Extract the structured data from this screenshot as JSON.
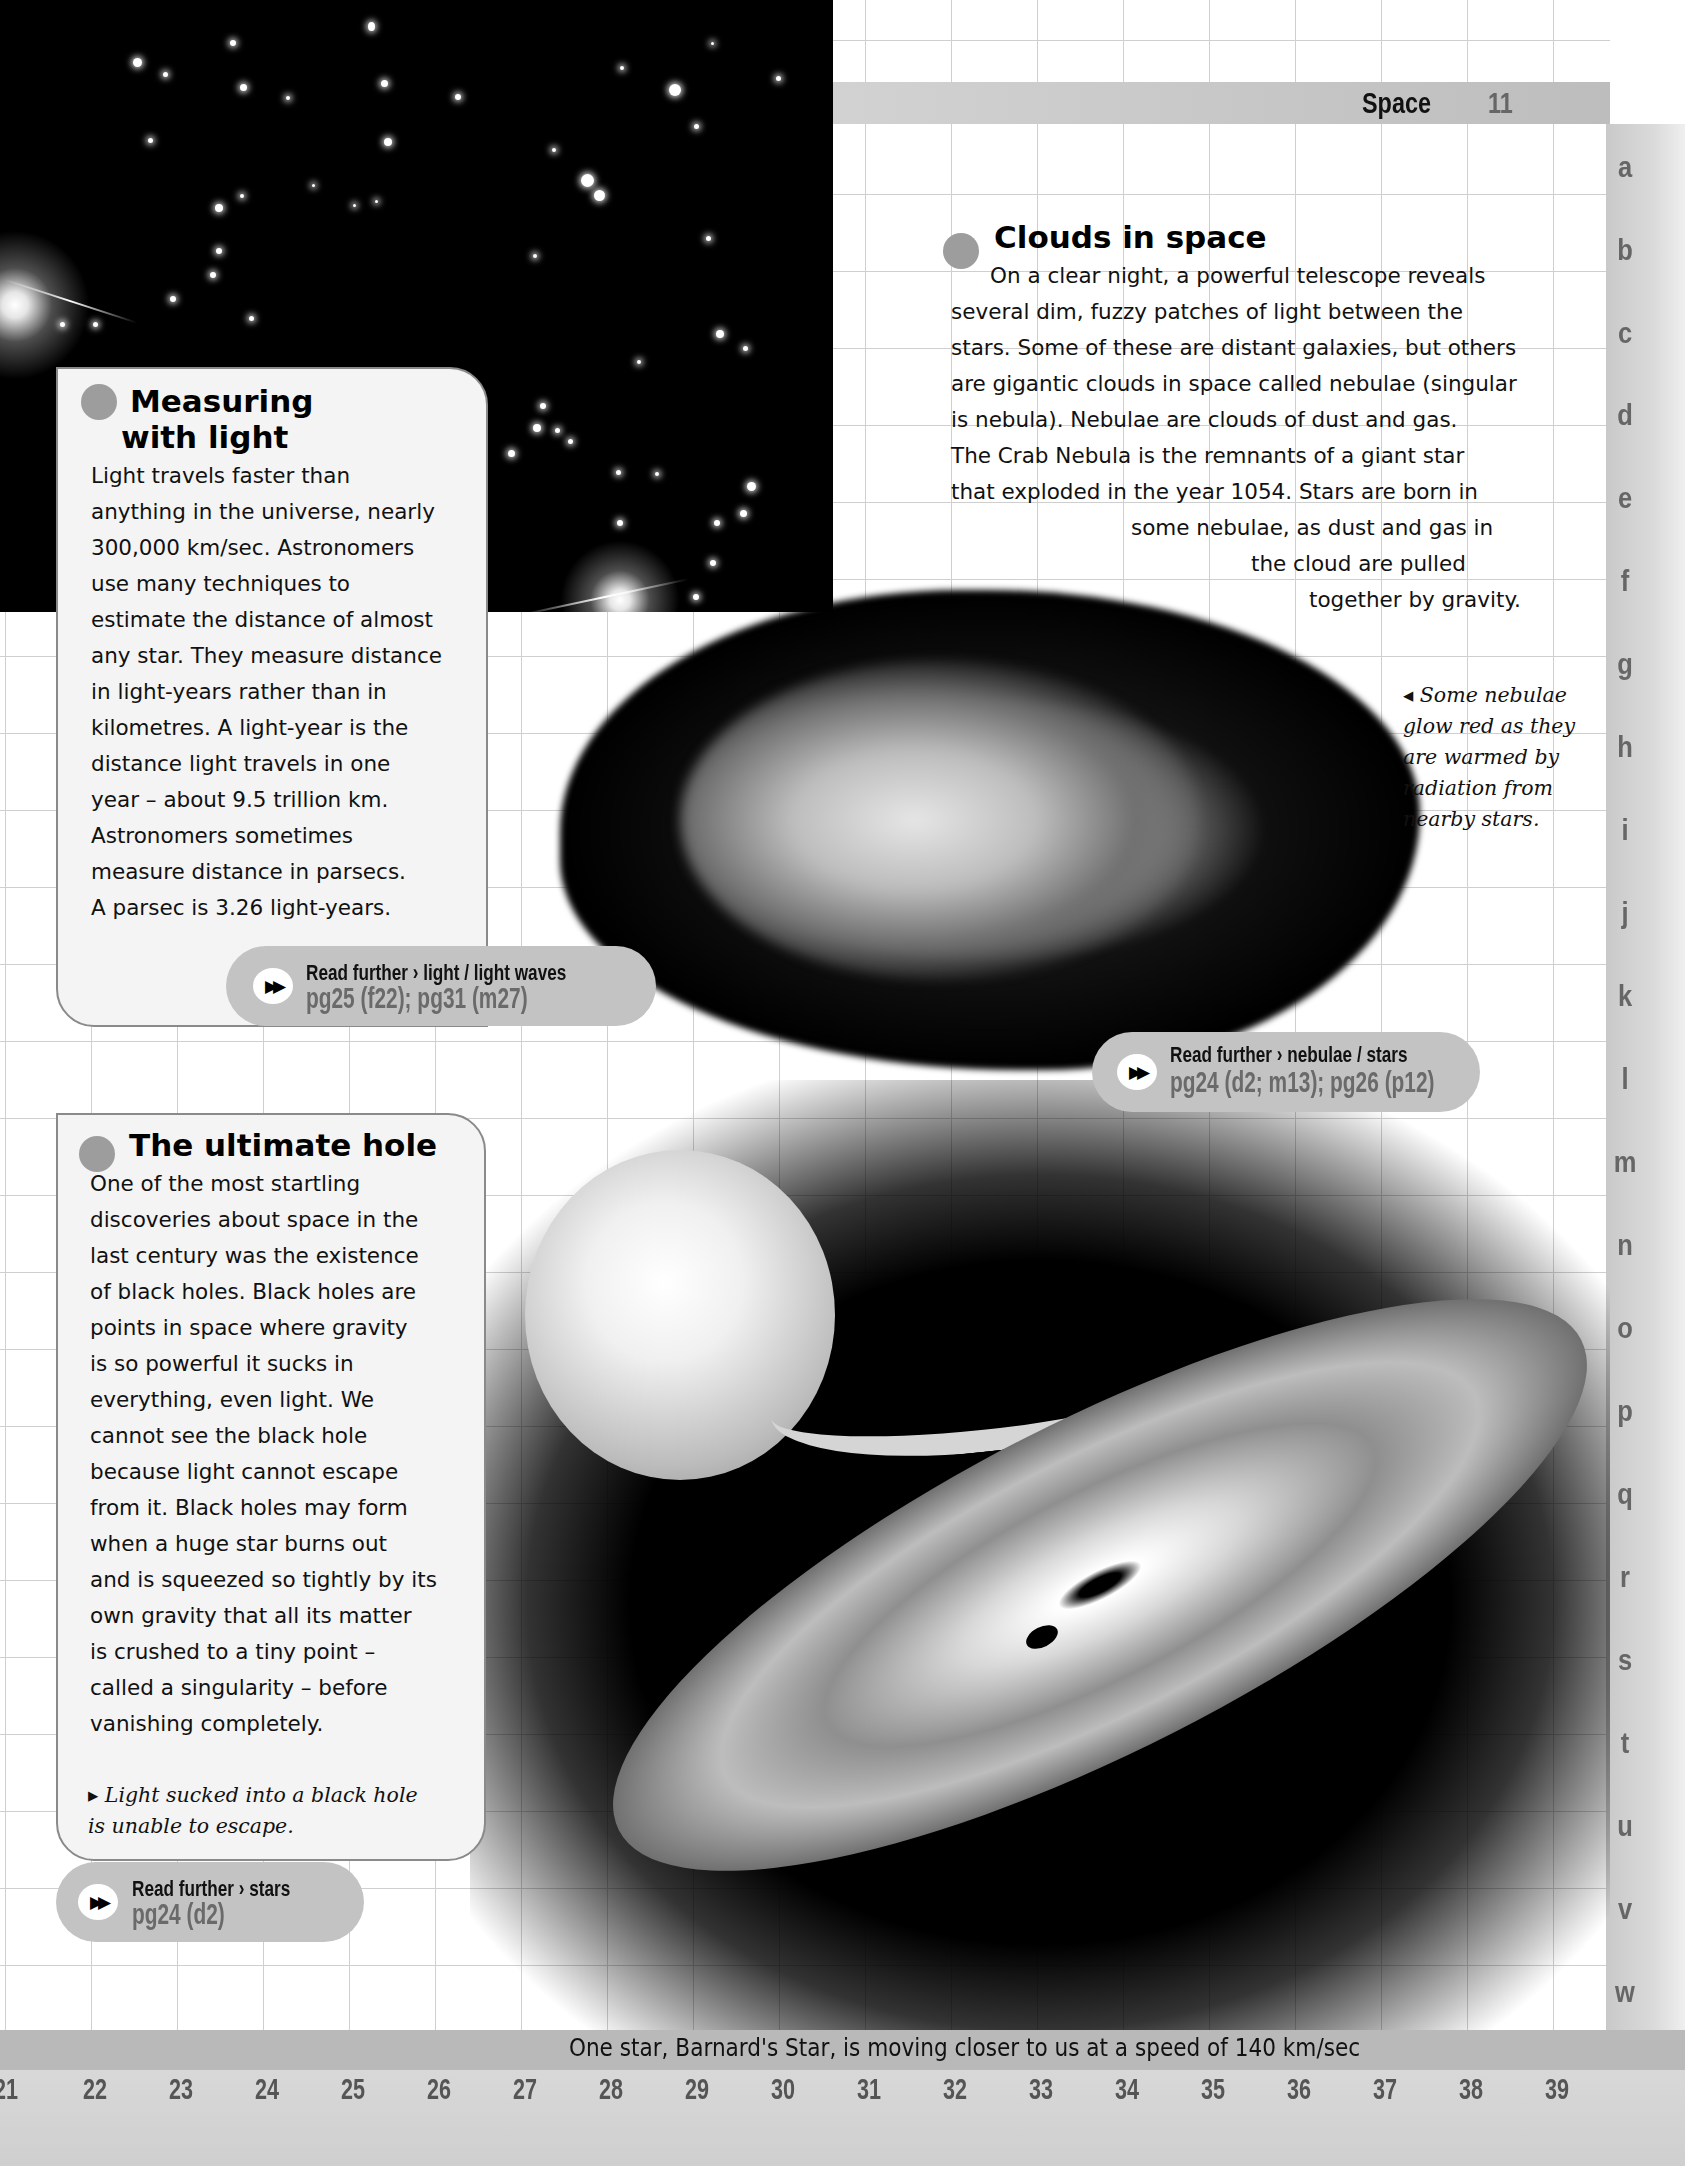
{
  "header": {
    "section_title": "Space",
    "page_number": "11"
  },
  "row_letters": [
    "a",
    "b",
    "c",
    "d",
    "e",
    "f",
    "g",
    "h",
    "i",
    "j",
    "k",
    "l",
    "m",
    "n",
    "o",
    "p",
    "q",
    "r",
    "s",
    "t",
    "u",
    "v",
    "w"
  ],
  "column_numbers": [
    "21",
    "22",
    "23",
    "24",
    "25",
    "26",
    "27",
    "28",
    "29",
    "30",
    "31",
    "32",
    "33",
    "34",
    "35",
    "36",
    "37",
    "38",
    "39"
  ],
  "clouds_in_space": {
    "heading": "Clouds in space",
    "lines": [
      "On a clear night, a powerful telescope reveals",
      "several dim, fuzzy patches of light between the",
      "stars. Some of these are distant galaxies, but others",
      "are gigantic clouds in space called nebulae (singular",
      "is nebula). Nebulae are clouds of dust and gas.",
      "The Crab Nebula is the remnants of a giant star",
      "that exploded in the year 1054. Stars are born in",
      "some nebulae, as dust and gas in",
      "the cloud are pulled",
      "together by gravity."
    ],
    "caption": "◂ Some nebulae\nglow red as they\nare warmed by\nradiation from\nnearby stars.",
    "read_further": {
      "line1": "Read further › nebulae / stars",
      "line2": "pg24 (d2; m13); pg26 (p12)"
    }
  },
  "measuring_with_light": {
    "heading_line1": "Measuring",
    "heading_line2": "with light",
    "body": "Light travels faster than\nanything in the universe, nearly\n300,000 km/sec. Astronomers\nuse many techniques to\nestimate the distance of almost\nany star. They measure distance\nin light-years rather than in\nkilometres. A light-year is the\ndistance light travels in one\nyear – about 9.5 trillion km.\nAstronomers sometimes\nmeasure distance in parsecs.\nA parsec is 3.26 light-years.",
    "read_further": {
      "line1": "Read further › light / light waves",
      "line2": "pg25 (f22); pg31 (m27)"
    }
  },
  "ultimate_hole": {
    "heading": "The ultimate hole",
    "body": "     One of the most startling\ndiscoveries about space in the\nlast century was the existence\nof black holes. Black holes are\npoints in space where gravity\nis so powerful it sucks in\neverything, even light. We\ncannot see the black hole\nbecause light cannot escape\nfrom it. Black holes may form\nwhen a huge star burns out\nand is squeezed so tightly by its\nown gravity that all its matter\nis crushed to a tiny point –\ncalled a singularity – before\nvanishing completely.",
    "caption": " ▸ Light sucked into a black hole\nis unable to escape.",
    "read_further": {
      "line1": "Read further › stars",
      "line2": "pg24 (d2)"
    }
  },
  "footer": {
    "fact": "One star, Barnard's Star, is moving closer to us at a speed of 140 km/sec"
  },
  "icons": {
    "read_further": "▶▶"
  },
  "colors": {
    "band_gray": "#b9b9b9",
    "bullet_gray": "#9d9d9d",
    "pill_gray": "#c3c3c3",
    "box_fill": "#f4f4f4"
  }
}
